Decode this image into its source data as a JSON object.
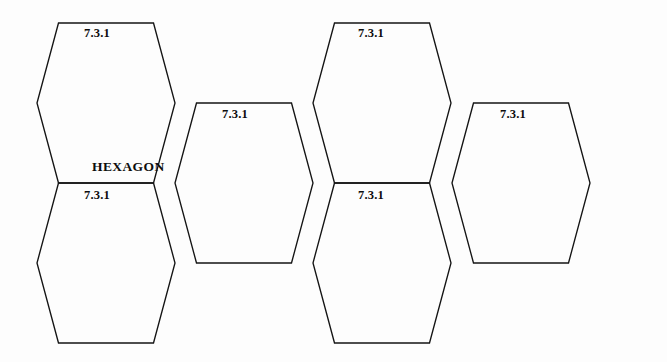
{
  "diagram": {
    "type": "hexagon-tiling",
    "background_color": "#fdfdfd",
    "stroke_color": "#141414",
    "title_label": "HEXAGON",
    "cells": [
      {
        "id": "hex-top-left",
        "label": "7.3.1",
        "label_x": 84,
        "label_y": 27,
        "center_x": 106,
        "center_y": 103,
        "title": "HEXAGON",
        "title_x": 92,
        "title_y": 160
      },
      {
        "id": "hex-top-mid-right",
        "label": "7.3.1",
        "label_x": 358,
        "label_y": 27,
        "center_x": 382,
        "center_y": 103,
        "title": "",
        "title_x": 0,
        "title_y": 0
      },
      {
        "id": "hex-mid-left",
        "label": "7.3.1",
        "label_x": 222,
        "label_y": 108,
        "center_x": 244,
        "center_y": 183,
        "title": "",
        "title_x": 0,
        "title_y": 0
      },
      {
        "id": "hex-mid-right",
        "label": "7.3.1",
        "label_x": 500,
        "label_y": 108,
        "center_x": 521,
        "center_y": 183,
        "title": "",
        "title_x": 0,
        "title_y": 0
      },
      {
        "id": "hex-bottom-left",
        "label": "7.3.1",
        "label_x": 84,
        "label_y": 189,
        "center_x": 106,
        "center_y": 263,
        "title": "",
        "title_x": 0,
        "title_y": 0
      },
      {
        "id": "hex-bottom-right",
        "label": "7.3.1",
        "label_x": 358,
        "label_y": 189,
        "center_x": 382,
        "center_y": 263,
        "title": "",
        "title_x": 0,
        "title_y": 0
      }
    ]
  }
}
